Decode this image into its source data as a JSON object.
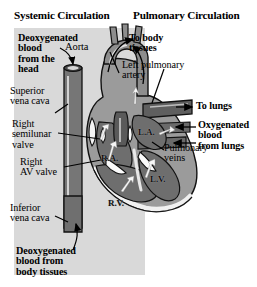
{
  "figure": {
    "type": "anatomical-diagram",
    "background_color": "#ffffff",
    "panel_color": "#d9d9d9"
  },
  "titles": {
    "systemic": "Systemic Circulation",
    "pulmonary": "Pulmonary Circulation"
  },
  "labels": {
    "deoxygenated_head": "Deoxygenated\nblood\nfrom the\nhead",
    "aorta": "Aorta",
    "to_body_tissues": "To body\ntissues",
    "superior_vena_cava": "Superior\nvena cava",
    "left_pulmonary_artery": "Left pulmonary\nartery",
    "right_semilunar_valve": "Right\nsemilunar\nvalve",
    "to_lungs": "To lungs",
    "oxygenated_from_lungs": "Oxygenated\nblood\nfrom lungs",
    "right_av_valve": "Right\nAV valve",
    "pulmonary_veins": "Pulmonary\nveins",
    "inferior_vena_cava": "Inferior\nvena cava",
    "deoxygenated_body": "Deoxygenated\nblood from\nbody tissues"
  },
  "chambers": {
    "right_atrium": "R.A.",
    "left_atrium": "L.A.",
    "right_ventricle": "R.V.",
    "left_ventricle": "L.V."
  },
  "colors": {
    "deoxygenated_vessel": "#767676",
    "oxygenated_vessel": "#5d5d5d",
    "heart_muscle": "#9b9b9b",
    "chamber_dark": "#6e6e6e",
    "outline": "#1a1a1a",
    "highlight": "#f2f2f2",
    "text": "#000000"
  }
}
